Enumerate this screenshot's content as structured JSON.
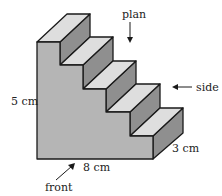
{
  "diagram": {
    "steps": 5,
    "colors": {
      "front_face": "#b5b5b5",
      "tread": "#dedede",
      "riser": "#8f8f8f",
      "outline": "#1a1a1a"
    },
    "labels": {
      "height": "5 cm",
      "width": "8 cm",
      "depth": "3 cm",
      "plan": "plan",
      "side": "side",
      "front": "front"
    }
  }
}
